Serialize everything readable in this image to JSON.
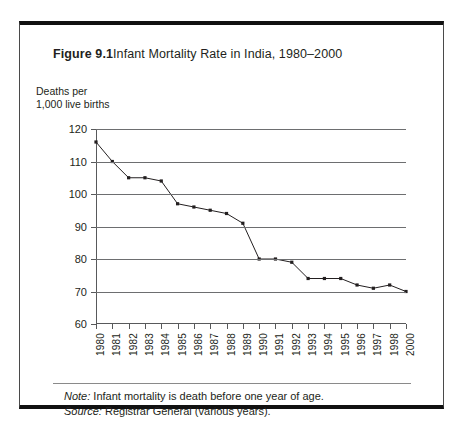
{
  "figure": {
    "label": "Figure 9.1",
    "title": "Infant Mortality Rate in India, 1980–2000",
    "note_lead": "Note:",
    "note_text": " Infant mortality is death before one year of age.",
    "source_lead": "Source:",
    "source_text": " Registrar General (various years)."
  },
  "chart_data": {
    "type": "line",
    "title": "Infant Mortality Rate in India, 1980–2000",
    "xlabel": "",
    "ylabel": "Deaths per 1,000 live births",
    "ylabel_line1": "Deaths per",
    "ylabel_line2": "1,000 live births",
    "ylim": [
      60,
      120
    ],
    "yticks": [
      60,
      70,
      80,
      90,
      100,
      110,
      120
    ],
    "grid": true,
    "legend": "none",
    "marker": "filled-square",
    "line_color": "#231f20",
    "grid_color": "#6d6e70",
    "categories": [
      "1980",
      "1981",
      "1982",
      "1983",
      "1984",
      "1985",
      "1986",
      "1987",
      "1988",
      "1989",
      "1990",
      "1991",
      "1992",
      "1993",
      "1994",
      "1995",
      "1996",
      "1997",
      "1998",
      "2000"
    ],
    "tick_labels": [
      "1980",
      "1981",
      "1982",
      "1983",
      "1984",
      "1985",
      "1986",
      "1987",
      "1988",
      "1989",
      "1990",
      "1991",
      "1992",
      "1993",
      "1994",
      "1995",
      "1996",
      "1997",
      "1998",
      "2000"
    ],
    "values": [
      116,
      110,
      105,
      105,
      104,
      97,
      96,
      95,
      94,
      91,
      80,
      80,
      79,
      74,
      74,
      74,
      72,
      71,
      72,
      70
    ]
  }
}
